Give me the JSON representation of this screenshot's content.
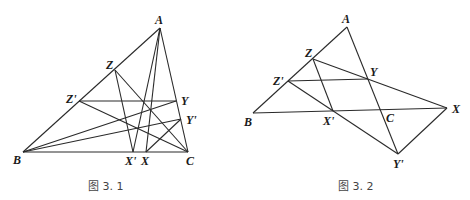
{
  "figures": [
    {
      "caption": "图 3. 1",
      "points": {
        "A": {
          "label": "A",
          "x": 160,
          "y": 28
        },
        "B": {
          "label": "B",
          "x": 23,
          "y": 152
        },
        "C": {
          "label": "C",
          "x": 188,
          "y": 152
        },
        "X": {
          "label": "X",
          "x": 146,
          "y": 152
        },
        "X'": {
          "label": "X'",
          "x": 133,
          "y": 152
        },
        "Y": {
          "label": "Y",
          "x": 176,
          "y": 101
        },
        "Y'": {
          "label": "Y'",
          "x": 181,
          "y": 119
        },
        "Z": {
          "label": "Z",
          "x": 115,
          "y": 70
        },
        "Z'": {
          "label": "Z'",
          "x": 79,
          "y": 101
        }
      },
      "segments": [
        [
          "A",
          "B"
        ],
        [
          "A",
          "C"
        ],
        [
          "B",
          "C"
        ],
        [
          "Z",
          "X'"
        ],
        [
          "Z",
          "C"
        ],
        [
          "Z'",
          "Y"
        ],
        [
          "Z'",
          "C"
        ],
        [
          "B",
          "Y"
        ],
        [
          "B",
          "Y'"
        ],
        [
          "A",
          "X'"
        ],
        [
          "A",
          "X"
        ],
        [
          "X",
          "Y'"
        ]
      ]
    },
    {
      "caption": "图 3. 2",
      "points": {
        "A": {
          "label": "A",
          "x": 347,
          "y": 27
        },
        "B": {
          "label": "B",
          "x": 253,
          "y": 113
        },
        "C": {
          "label": "C",
          "x": 381,
          "y": 111
        },
        "X": {
          "label": "X",
          "x": 447,
          "y": 108
        },
        "X'": {
          "label": "X'",
          "x": 333,
          "y": 111
        },
        "Y": {
          "label": "Y",
          "x": 368,
          "y": 79
        },
        "Y'": {
          "label": "Y'",
          "x": 398,
          "y": 154
        },
        "Z": {
          "label": "Z",
          "x": 313,
          "y": 59
        },
        "Z'": {
          "label": "Z'",
          "x": 288,
          "y": 81
        }
      },
      "segments": [
        [
          "A",
          "B"
        ],
        [
          "A",
          "Y'"
        ],
        [
          "B",
          "X"
        ],
        [
          "Z",
          "X'"
        ],
        [
          "Z",
          "X"
        ],
        [
          "Z'",
          "Y"
        ],
        [
          "Z'",
          "Y'"
        ],
        [
          "X",
          "Y'"
        ]
      ]
    }
  ]
}
